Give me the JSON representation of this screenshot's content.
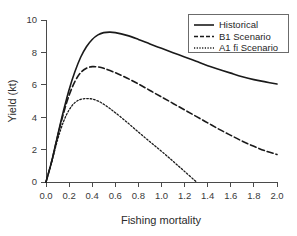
{
  "chart_data": {
    "type": "line",
    "title": "",
    "xlabel": "Fishing mortality",
    "ylabel": "Yield (kt)",
    "xlim": [
      0.0,
      2.0
    ],
    "ylim": [
      0,
      10
    ],
    "grid": false,
    "legend_position": "top-right",
    "xticks": [
      "0.0",
      "0.2",
      "0.4",
      "0.6",
      "0.8",
      "1.0",
      "1.2",
      "1.4",
      "1.6",
      "1.8",
      "2.0"
    ],
    "xtick_values": [
      0.0,
      0.2,
      0.4,
      0.6,
      0.8,
      1.0,
      1.2,
      1.4,
      1.6,
      1.8,
      2.0
    ],
    "yticks": [
      "0",
      "2",
      "4",
      "6",
      "8",
      "10"
    ],
    "ytick_values": [
      0,
      2,
      4,
      6,
      8,
      10
    ],
    "series": [
      {
        "name": "Historical",
        "style": "solid",
        "color": "#1a1a1a",
        "x": [
          0.0,
          0.05,
          0.1,
          0.15,
          0.2,
          0.25,
          0.3,
          0.35,
          0.4,
          0.45,
          0.5,
          0.55,
          0.6,
          0.7,
          0.8,
          0.9,
          1.0,
          1.1,
          1.2,
          1.3,
          1.4,
          1.5,
          1.6,
          1.7,
          1.8,
          1.9,
          2.0
        ],
        "y": [
          0.0,
          1.3,
          2.85,
          4.35,
          5.7,
          6.8,
          7.7,
          8.35,
          8.8,
          9.08,
          9.22,
          9.25,
          9.22,
          9.05,
          8.8,
          8.52,
          8.25,
          7.98,
          7.72,
          7.45,
          7.18,
          6.95,
          6.72,
          6.5,
          6.32,
          6.18,
          6.05
        ]
      },
      {
        "name": "B1 Scenario",
        "style": "dashed",
        "color": "#1a1a1a",
        "x": [
          0.0,
          0.05,
          0.1,
          0.15,
          0.2,
          0.25,
          0.3,
          0.35,
          0.4,
          0.45,
          0.5,
          0.6,
          0.7,
          0.8,
          0.9,
          1.0,
          1.1,
          1.2,
          1.3,
          1.4,
          1.5,
          1.6,
          1.7,
          1.8,
          1.9,
          2.0
        ],
        "y": [
          0.0,
          1.3,
          2.8,
          4.2,
          5.35,
          6.2,
          6.75,
          7.02,
          7.12,
          7.1,
          7.02,
          6.75,
          6.42,
          6.05,
          5.65,
          5.25,
          4.85,
          4.45,
          4.05,
          3.65,
          3.25,
          2.88,
          2.52,
          2.2,
          1.92,
          1.7
        ]
      },
      {
        "name": "A1 fi Scenario",
        "style": "dotted",
        "color": "#1a1a1a",
        "x": [
          0.0,
          0.05,
          0.1,
          0.15,
          0.2,
          0.25,
          0.3,
          0.35,
          0.4,
          0.45,
          0.5,
          0.55,
          0.6,
          0.7,
          0.8,
          0.9,
          1.0,
          1.1,
          1.2,
          1.3
        ],
        "y": [
          0.0,
          1.25,
          2.6,
          3.7,
          4.45,
          4.9,
          5.1,
          5.15,
          5.12,
          5.0,
          4.8,
          4.55,
          4.28,
          3.7,
          3.08,
          2.48,
          1.9,
          1.28,
          0.65,
          0.02
        ]
      }
    ],
    "peaks": [
      {
        "series": "Historical",
        "x": 0.55,
        "y": 9.25
      },
      {
        "series": "B1 Scenario",
        "x": 0.4,
        "y": 7.12
      },
      {
        "series": "A1 fi Scenario",
        "x": 0.35,
        "y": 5.15
      }
    ],
    "endpoints": [
      {
        "series": "Historical",
        "x": 2.0,
        "y": 6.05
      },
      {
        "series": "B1 Scenario",
        "x": 2.0,
        "y": 1.7
      },
      {
        "series": "A1 fi Scenario",
        "x": 1.3,
        "y": 0.0
      }
    ]
  },
  "legend": {
    "items": [
      {
        "label": "Historical",
        "style": "solid"
      },
      {
        "label": "B1 Scenario",
        "style": "dashed"
      },
      {
        "label": "A1 fi Scenario",
        "style": "dotted"
      }
    ]
  }
}
